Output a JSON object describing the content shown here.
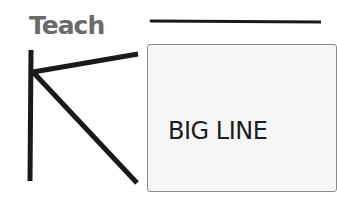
{
  "header": {
    "title": "Teach"
  },
  "illustration": {
    "letter": "K",
    "stroke_color": "#1a1a1a"
  },
  "card": {
    "label": "BIG LINE"
  },
  "colors": {
    "title": "#6b6b6b",
    "card_background": "#f6f6f6",
    "card_border": "#8a8a8a",
    "text": "#1c1c1c",
    "line": "#1a1a1a"
  }
}
